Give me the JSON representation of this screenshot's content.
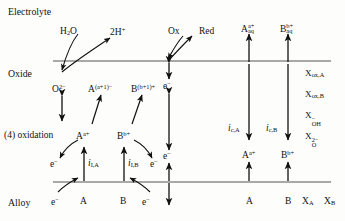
{
  "figure": {
    "type": "schematic-diagram",
    "zones": [
      {
        "id": "electrolyte",
        "label": "Electrolyte"
      },
      {
        "id": "oxide",
        "label": "Oxide"
      },
      {
        "id": "alloy",
        "label": "Alloy"
      }
    ],
    "interface_lines": [
      {
        "id": "electrolyte-oxide-interface",
        "y": 61
      },
      {
        "id": "oxide-alloy-interface",
        "y": 182
      }
    ],
    "process_note": "(4) oxidation"
  },
  "electrolyte_species": [
    {
      "id": "water",
      "text": "H",
      "sub": "2",
      "tail": "O"
    },
    {
      "id": "protons",
      "text": "2H",
      "sup": "+"
    },
    {
      "id": "oxidant",
      "text": "Ox"
    },
    {
      "id": "reductant",
      "text": "Red"
    },
    {
      "id": "a-aqueous",
      "base": "A",
      "sup": "a+",
      "sub": "aq"
    },
    {
      "id": "b-aqueous",
      "base": "B",
      "sup": "b+",
      "sub": "aq"
    }
  ],
  "oxide_species": [
    {
      "id": "oxide-ion",
      "base": "O",
      "sup": "2−"
    },
    {
      "id": "a-interstitial",
      "base": "A",
      "sup": "(a+1)−"
    },
    {
      "id": "b-interstitial",
      "base": "B",
      "sup": "(b+1)+"
    },
    {
      "id": "electron-upper",
      "base": "e",
      "sup": "−"
    },
    {
      "id": "electron-lower",
      "base": "e",
      "sup": "−"
    },
    {
      "id": "a-cation-oxide",
      "base": "A",
      "sup": "a+"
    },
    {
      "id": "b-cation-oxide",
      "base": "B",
      "sup": "b+"
    },
    {
      "id": "electron-left",
      "base": "e",
      "sup": "−"
    },
    {
      "id": "electron-right",
      "base": "e",
      "sup": "−"
    },
    {
      "id": "a-cation-transport",
      "base": "A",
      "sup": "a+"
    },
    {
      "id": "b-cation-transport",
      "base": "B",
      "sup": "b+"
    }
  ],
  "alloy_species": [
    {
      "id": "electron-alloy-left",
      "base": "e",
      "sup": "−"
    },
    {
      "id": "alloy-a-left",
      "base": "A"
    },
    {
      "id": "alloy-b-left",
      "base": "B"
    },
    {
      "id": "electron-alloy-right",
      "base": "e",
      "sup": "−"
    },
    {
      "id": "alloy-a-right",
      "base": "A"
    },
    {
      "id": "alloy-b-right",
      "base": "B"
    },
    {
      "id": "mole-fraction-a",
      "base": "X",
      "sub": "A"
    },
    {
      "id": "mole-fraction-b",
      "base": "X",
      "sub": "B"
    }
  ],
  "currents": [
    {
      "id": "ionic-current-a",
      "symbol": "i",
      "sub": "I,A"
    },
    {
      "id": "ionic-current-b",
      "symbol": "i",
      "sub": "I,B"
    },
    {
      "id": "cation-current-a",
      "symbol": "i",
      "sub": "c,A"
    },
    {
      "id": "cation-current-b",
      "symbol": "i",
      "sub": "c,B"
    }
  ],
  "oxide_composition_labels": [
    {
      "id": "x-ox-a",
      "base": "X",
      "sub": "ox,A"
    },
    {
      "id": "x-ox-b",
      "base": "X",
      "sub": "ox,B"
    },
    {
      "id": "x-oh",
      "base": "X",
      "sub": "OH",
      "sup": "−"
    },
    {
      "id": "x-o",
      "base": "X",
      "sub": "O",
      "sup": "2−"
    }
  ],
  "colors": {
    "ink": "#111111",
    "line": "#555555",
    "background": "#fdfdfc"
  }
}
